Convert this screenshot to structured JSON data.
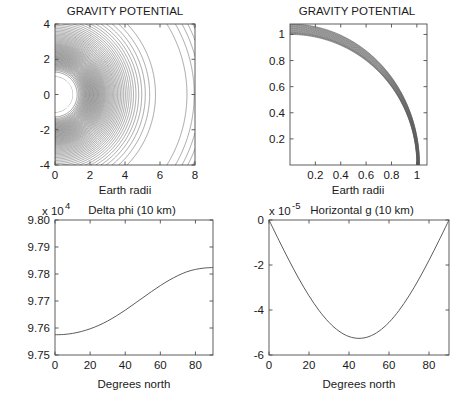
{
  "figure": {
    "width": 465,
    "height": 395,
    "background": "#ffffff",
    "line_color": "#4a4a4a",
    "axis_color": "#4d4d4d"
  },
  "chart_data": [
    {
      "id": "gravity-potential-wide",
      "type": "contour",
      "title": "GRAVITY POTENTIAL",
      "xlabel": "Earth radii",
      "ylabel": "",
      "xlim": [
        0,
        8
      ],
      "ylim": [
        -4,
        4
      ],
      "xticks": [
        0,
        2,
        4,
        6,
        8
      ],
      "yticks": [
        -4,
        -2,
        0,
        2,
        4
      ],
      "xtick_labels": [
        "0",
        "2",
        "4",
        "6",
        "8"
      ],
      "ytick_labels": [
        "-4",
        "-2",
        "0",
        "2",
        "4"
      ],
      "grid": false,
      "legend": "none",
      "n_contours": 60,
      "description": "Co-rotating (Roche) gravity potential of the Earth with centrifugal term; dense nested contours crowd the white half-disk of radius 1 at the origin, opening out to a saddle point near x = 6.6, y = 0 where contours cross in an X pattern.",
      "annotations": [
        {
          "label": "Earth disk",
          "x": 0,
          "y": 0,
          "radius": 1
        },
        {
          "label": "saddle point",
          "x": 6.6,
          "y": 0
        }
      ]
    },
    {
      "id": "gravity-potential-zoom",
      "type": "contour",
      "title": "GRAVITY POTENTIAL",
      "xlabel": "Earth radii",
      "ylabel": "",
      "xlim": [
        0,
        1.08
      ],
      "ylim": [
        0,
        1.08
      ],
      "xticks": [
        0.2,
        0.4,
        0.6,
        0.8,
        1
      ],
      "yticks": [
        0.2,
        0.4,
        0.6,
        0.8,
        1
      ],
      "xtick_labels": [
        "0.2",
        "0.4",
        "0.6",
        "0.8",
        "1"
      ],
      "ytick_labels": [
        "0.2",
        "0.4",
        "0.6",
        "0.8",
        "1"
      ],
      "grid": false,
      "legend": "none",
      "n_contours": 20,
      "radii": [
        1.0,
        1.004,
        1.008,
        1.012,
        1.016,
        1.021,
        1.026,
        1.031,
        1.036,
        1.041,
        1.046,
        1.051,
        1.056,
        1.061,
        1.066,
        1.071,
        1.076,
        1.08
      ],
      "description": "Close-up on the first quadrant near the Earth's surface; the equipotentials are nested near-circular arcs of radius slightly greater than 1, spaced closely and fanning toward the upper-right corner."
    },
    {
      "id": "delta-phi",
      "type": "line",
      "title": "Delta phi (10 km)",
      "xlabel": "Degrees north",
      "ylabel": "",
      "y_exponent_label": "x 10",
      "y_exponent": "4",
      "xlim": [
        0,
        90
      ],
      "ylim": [
        9.75,
        9.8
      ],
      "xticks": [
        0,
        20,
        40,
        60,
        80
      ],
      "yticks": [
        9.75,
        9.76,
        9.77,
        9.78,
        9.79,
        9.8
      ],
      "xtick_labels": [
        "0",
        "20",
        "40",
        "60",
        "80"
      ],
      "ytick_labels": [
        "9.75",
        "9.76",
        "9.77",
        "9.78",
        "9.79",
        "9.80"
      ],
      "grid": false,
      "legend": "none",
      "series": [
        {
          "name": "Delta phi",
          "x": [
            0,
            5,
            10,
            15,
            20,
            25,
            30,
            35,
            40,
            45,
            50,
            55,
            60,
            65,
            70,
            75,
            80,
            85,
            90
          ],
          "y": [
            9.7575,
            9.7576,
            9.758,
            9.7587,
            9.7597,
            9.761,
            9.7626,
            9.7645,
            9.7666,
            9.7689,
            9.7712,
            9.7735,
            9.7757,
            9.7777,
            9.7794,
            9.7808,
            9.7817,
            9.7822,
            9.7824
          ]
        }
      ],
      "description": "Monotonic sigmoidal rise of the geopotential at 10 km altitude from about 9.7575e4 at the equator to about 9.7905e4 near the pole, steepest around 45 degrees north."
    },
    {
      "id": "horizontal-g",
      "type": "line",
      "title": "Horizontal g (10 km)",
      "xlabel": "Degrees north",
      "ylabel": "",
      "y_exponent_label": "x 10",
      "y_exponent": "-5",
      "xlim": [
        0,
        90
      ],
      "ylim": [
        -6,
        0
      ],
      "xticks": [
        0,
        20,
        40,
        60,
        80
      ],
      "yticks": [
        -6,
        -4,
        -2,
        0
      ],
      "xtick_labels": [
        "0",
        "20",
        "40",
        "60",
        "80"
      ],
      "ytick_labels": [
        "-6",
        "-4",
        "-2",
        "0"
      ],
      "grid": false,
      "legend": "none",
      "series": [
        {
          "name": "Horizontal g",
          "x": [
            0,
            5,
            10,
            15,
            20,
            25,
            30,
            35,
            40,
            45,
            50,
            55,
            60,
            65,
            70,
            75,
            80,
            85,
            90
          ],
          "y": [
            0,
            -0.91,
            -1.79,
            -2.62,
            -3.37,
            -4.02,
            -4.55,
            -4.94,
            -5.18,
            -5.26,
            -5.18,
            -4.94,
            -4.55,
            -4.02,
            -3.37,
            -2.62,
            -1.79,
            -0.91,
            0
          ]
        }
      ],
      "description": "Horizontal component of gravity at 10 km altitude, a negative sinusoidal lobe proportional to -sin(2*latitude); zero at the equator and pole with a minimum of about -5.26e-5 at 45 degrees north."
    }
  ]
}
